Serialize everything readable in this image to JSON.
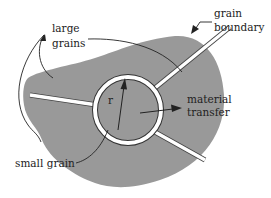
{
  "diagram": {
    "colors": {
      "background": "#ffffff",
      "grain_fill": "#999999",
      "boundary": "#ffffff",
      "ink": "#222222"
    },
    "labels": {
      "large_grains_line1": "large",
      "large_grains_line2": "grains",
      "grain_boundary_line1": "grain",
      "grain_boundary_line2": "boundary",
      "material_transfer_line1": "material",
      "material_transfer_line2": "transfer",
      "small_grain": "small grain",
      "radius": "r"
    }
  }
}
